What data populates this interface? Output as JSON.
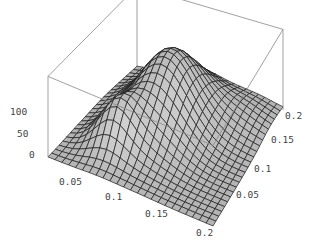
{
  "chart_data": {
    "type": "surface3d",
    "title": "",
    "xlabel": "",
    "ylabel": "",
    "zlabel": "",
    "x_range": [
      0,
      0.2
    ],
    "y_range": [
      0,
      0.2
    ],
    "z_range": [
      0,
      130
    ],
    "x_ticks": [
      "0.05",
      "0.1",
      "0.15",
      "0.2"
    ],
    "y_ticks": [
      "0.05",
      "0.1",
      "0.15",
      "0.2"
    ],
    "z_ticks": [
      "0",
      "50",
      "100"
    ],
    "grid_n": 24,
    "peaks": [
      {
        "x": 0.085,
        "y": 0.125,
        "z": 115,
        "sx": 0.035,
        "sy": 0.045
      },
      {
        "x": 0.055,
        "y": 0.055,
        "z": 55,
        "sx": 0.02,
        "sy": 0.02
      },
      {
        "x": 0.16,
        "y": 0.17,
        "z": 20,
        "sx": 0.03,
        "sy": 0.03
      }
    ],
    "box": true,
    "mesh_color": "#1a1a1a",
    "surface_color": "#b4b4b4",
    "box_color": "#888888"
  }
}
